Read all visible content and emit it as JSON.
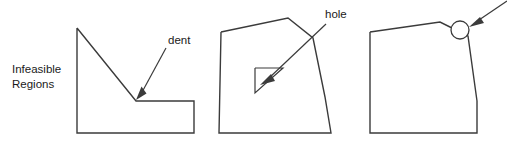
{
  "figure": {
    "background_color": "#ffffff",
    "stroke_color": "#3b3b3b",
    "text_color": "#1a1a1a",
    "width": 507,
    "height": 150,
    "caption_label_line1": "Infeasible",
    "caption_label_line2": "Regions",
    "annotations": {
      "dent_label": "dent",
      "hole_label": "hole",
      "bump_label": ""
    },
    "panels": [
      {
        "id": "panel-dent",
        "name": "dent-region",
        "annotation": "dent",
        "description": "polygon with a concave dent on the upper right",
        "outline_points": "77,28 77,133 194,133 194,101 136,101 77,28",
        "leader_line": "166,48 140,95",
        "arrow_tip": [
          136,
          99
        ],
        "label_x": 168,
        "label_y": 44
      },
      {
        "id": "panel-hole",
        "name": "hole-region",
        "annotation": "hole",
        "description": "polygon containing an interior triangular hole",
        "outline_points": "221,32 288,18 313,38 325,97 331,133 219,133 221,32",
        "hole_points": "255,68 283,68 255,93 255,68",
        "leader_line": "326,24 267,80",
        "arrow_tip": [
          261,
          85
        ],
        "label_x": 325,
        "label_y": 18
      },
      {
        "id": "panel-bump",
        "name": "bump-region",
        "annotation": "",
        "description": "polygon with a small circular marker on its upper right vertex",
        "outline_points": "370,32 440,22 452,28 468,36 477,101 477,133 370,133 370,32",
        "marker_circle": {
          "cx": 460,
          "cy": 30,
          "r": 9
        },
        "leader_line": "507,2 473,24",
        "arrow_tip": [
          469,
          27
        ],
        "label_x": 0,
        "label_y": 0
      }
    ]
  }
}
